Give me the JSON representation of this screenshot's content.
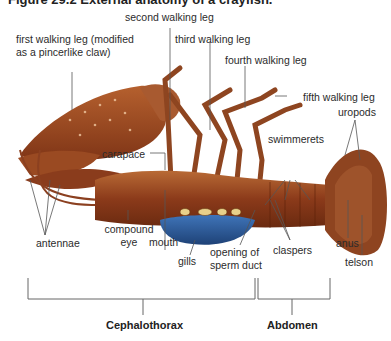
{
  "figure": {
    "heading": "Figure 29.2 External anatomy of a crayfish."
  },
  "labels": {
    "second_walking_leg": "second walking leg",
    "first_walking_leg_line1": "first walking leg (modified",
    "first_walking_leg_line2": "as a pincerlike claw)",
    "third_walking_leg": "third walking leg",
    "fourth_walking_leg": "fourth walking leg",
    "fifth_walking_leg": "fifth walking leg",
    "uropods": "uropods",
    "swimmerets": "swimmerets",
    "carapace": "carapace",
    "antennae": "antennae",
    "compound_eye_line1": "compound",
    "compound_eye_line2": "eye",
    "mouth": "mouth",
    "gills": "gills",
    "opening_line1": "opening of",
    "opening_line2": "sperm duct",
    "claspers": "claspers",
    "anus": "anus",
    "telson": "telson"
  },
  "regions": {
    "cephalothorax": "Cephalothorax",
    "abdomen": "Abdomen"
  },
  "colors": {
    "body": "#8b3a1a",
    "body_light": "#b5652f",
    "gills": "#2f5f9e",
    "leader_line": "#555555",
    "bracket": "#666666"
  }
}
